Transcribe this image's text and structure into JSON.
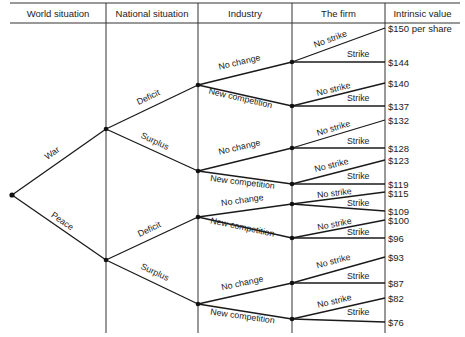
{
  "headers": {
    "world": "World situation",
    "national": "National situation",
    "industry": "Industry",
    "firm": "The firm",
    "value": "Intrinsic value"
  },
  "branches": {
    "war": "War",
    "peace": "Peace",
    "deficit": "Deficit",
    "surplus": "Surplus",
    "no_change": "No change",
    "new_competition": "New competition",
    "no_strike": "No strike",
    "strike": "Strike"
  },
  "values": [
    "$150 per share",
    "$144",
    "$140",
    "$137",
    "$132",
    "$128",
    "$123",
    "$119",
    "$115",
    "$109",
    "$100",
    "$96",
    "$93",
    "$87",
    "$82",
    "$76"
  ],
  "colors": {
    "line": "#1a1a1a",
    "grid": "#333333",
    "text": "#222222"
  }
}
